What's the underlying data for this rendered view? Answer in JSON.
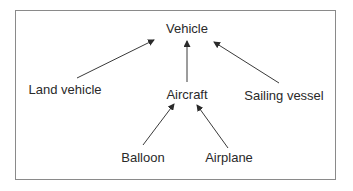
{
  "diagram": {
    "type": "hierarchy",
    "nodes": [
      {
        "id": "vehicle",
        "label": "Vehicle",
        "x": 187,
        "y": 28
      },
      {
        "id": "land_vehicle",
        "label": "Land vehicle",
        "x": 65,
        "y": 89
      },
      {
        "id": "aircraft",
        "label": "Aircraft",
        "x": 187,
        "y": 94
      },
      {
        "id": "sailing_vessel",
        "label": "Sailing vessel",
        "x": 284,
        "y": 95
      },
      {
        "id": "balloon",
        "label": "Balloon",
        "x": 143,
        "y": 157
      },
      {
        "id": "airplane",
        "label": "Airplane",
        "x": 229,
        "y": 157
      }
    ],
    "edges": [
      {
        "from": "land_vehicle",
        "to": "vehicle",
        "x1": 77,
        "y1": 78,
        "x2": 154,
        "y2": 40
      },
      {
        "from": "aircraft",
        "to": "vehicle",
        "x1": 187,
        "y1": 82,
        "x2": 187,
        "y2": 41
      },
      {
        "from": "sailing_vessel",
        "to": "vehicle",
        "x1": 279,
        "y1": 83,
        "x2": 214,
        "y2": 42
      },
      {
        "from": "balloon",
        "to": "aircraft",
        "x1": 143,
        "y1": 145,
        "x2": 174,
        "y2": 104
      },
      {
        "from": "airplane",
        "to": "aircraft",
        "x1": 228,
        "y1": 148,
        "x2": 197,
        "y2": 105
      }
    ],
    "colors": {
      "line": "#3a3a3a",
      "text": "#2a2a2a",
      "border": "#8a8a8a"
    }
  }
}
